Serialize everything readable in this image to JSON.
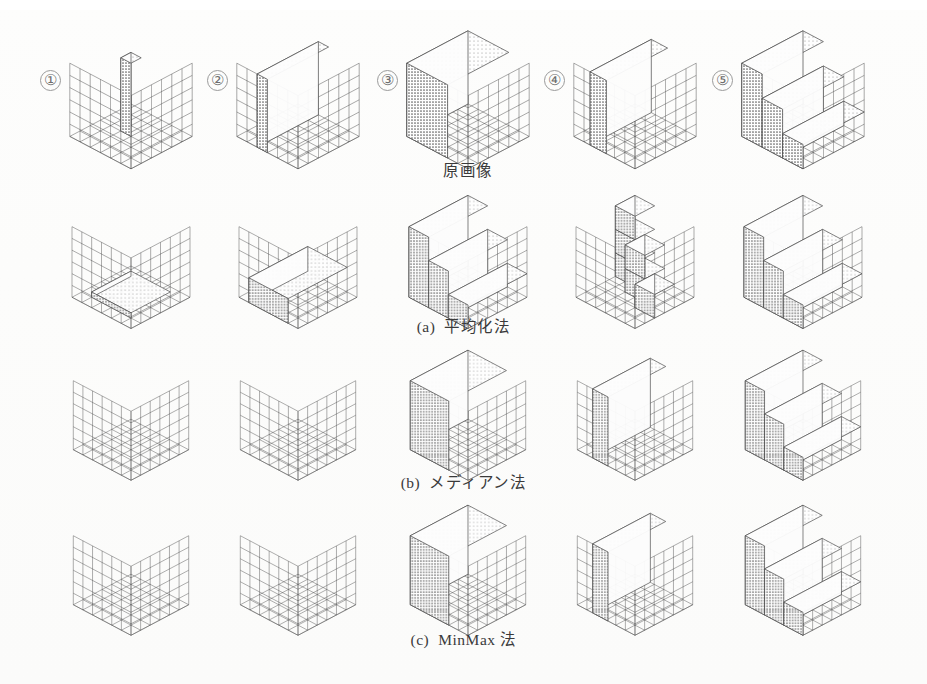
{
  "figure": {
    "width": 927,
    "height": 684,
    "background": "#ffffff",
    "ink": "#4a4a4a",
    "partial_top_text": "図 3  前処理手法による三次元形状の比較"
  },
  "column_numbers": [
    "①",
    "②",
    "③",
    "④",
    "⑤"
  ],
  "rows": [
    {
      "id": "row-original",
      "caption_label": "",
      "caption_text": "原画像",
      "top": 20,
      "height": 140,
      "caption_y": 158,
      "panels": [
        {
          "num": "①",
          "shape": "thin-vertical-slab",
          "desc": "細い縦スラブ"
        },
        {
          "num": "②",
          "shape": "tall-wall",
          "desc": "高い壁面"
        },
        {
          "num": "③",
          "shape": "full-block",
          "desc": "充填ブロック"
        },
        {
          "num": "④",
          "shape": "tall-wall-thick",
          "desc": "厚い壁面"
        },
        {
          "num": "⑤",
          "shape": "staircase",
          "desc": "階段状"
        }
      ]
    },
    {
      "id": "row-a",
      "caption_label": "(a)",
      "caption_text": "平均化法",
      "top": 185,
      "height": 135,
      "caption_y": 314,
      "panels": [
        {
          "num": "①",
          "shape": "thin-floor-slab",
          "desc": "床面の薄板"
        },
        {
          "num": "②",
          "shape": "low-block",
          "desc": "低いブロック"
        },
        {
          "num": "③",
          "shape": "staircase",
          "desc": "階段状"
        },
        {
          "num": "④",
          "shape": "scattered-cubes",
          "desc": "散在する立方体"
        },
        {
          "num": "⑤",
          "shape": "staircase",
          "desc": "階段状"
        }
      ]
    },
    {
      "id": "row-b",
      "caption_label": "(b)",
      "caption_text": "メディアン法",
      "top": 340,
      "height": 132,
      "caption_y": 470,
      "panels": [
        {
          "num": "①",
          "shape": "empty-grid",
          "desc": "空"
        },
        {
          "num": "②",
          "shape": "empty-grid",
          "desc": "空"
        },
        {
          "num": "③",
          "shape": "full-block",
          "desc": "充填ブロック"
        },
        {
          "num": "④",
          "shape": "tall-wall-thick",
          "desc": "厚い壁面"
        },
        {
          "num": "⑤",
          "shape": "staircase",
          "desc": "階段状"
        }
      ]
    },
    {
      "id": "row-c",
      "caption_label": "(c)",
      "caption_text": "MinMax 法",
      "top": 495,
      "height": 132,
      "caption_y": 627,
      "panels": [
        {
          "num": "①",
          "shape": "empty-grid",
          "desc": "空"
        },
        {
          "num": "②",
          "shape": "empty-grid",
          "desc": "空"
        },
        {
          "num": "③",
          "shape": "full-block",
          "desc": "充填ブロック"
        },
        {
          "num": "④",
          "shape": "tall-wall-thick",
          "desc": "厚い壁面"
        },
        {
          "num": "⑤",
          "shape": "staircase",
          "desc": "階段状"
        }
      ]
    }
  ],
  "chart_data": {
    "type": "heatmap",
    "title": "前処理手法による三次元形状の比較",
    "xlabel": "",
    "ylabel": "",
    "grid": true,
    "legend_position": "none",
    "axis_note": "各パネルは 6x6x6 のボクセルグリッドを等角投影で描画",
    "categories": [
      "①",
      "②",
      "③",
      "④",
      "⑤"
    ],
    "series": [
      {
        "name": "原画像",
        "values": [
          "thin-vertical-slab",
          "tall-wall",
          "full-block",
          "tall-wall-thick",
          "staircase"
        ]
      },
      {
        "name": "(a) 平均化法",
        "values": [
          "thin-floor-slab",
          "low-block",
          "staircase",
          "scattered-cubes",
          "staircase"
        ]
      },
      {
        "name": "(b) メディアン法",
        "values": [
          "empty-grid",
          "empty-grid",
          "full-block",
          "tall-wall-thick",
          "staircase"
        ]
      },
      {
        "name": "(c) MinMax 法",
        "values": [
          "empty-grid",
          "empty-grid",
          "full-block",
          "tall-wall-thick",
          "staircase"
        ]
      }
    ]
  }
}
